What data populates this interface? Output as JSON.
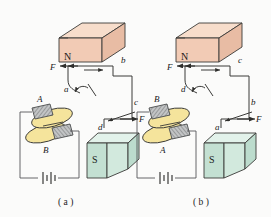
{
  "figure": {
    "type": "physics-diagram",
    "captions": [
      {
        "id": "caption-a",
        "text": "( a )"
      },
      {
        "id": "caption-b",
        "text": "( b )"
      }
    ],
    "colors": {
      "north_magnet_face": "#e8bca4",
      "north_magnet_top": "#f7ddcb",
      "north_magnet_side": "#f2cbb5",
      "south_magnet_face": "#c3e0d2",
      "south_magnet_top": "#e2f2ea",
      "south_magnet_side": "#d2e9dd",
      "commutator_disc": "#f5e49c",
      "brush_gray": "#b9bbbc",
      "wire": "#3a3a38",
      "background": "#fbfbfa"
    }
  },
  "panels": [
    {
      "id": "panel-a",
      "caption": "( a )",
      "magnets": [
        {
          "id": "north",
          "pole_label": "N",
          "position": "top"
        },
        {
          "id": "south",
          "pole_label": "S",
          "position": "bottom-right"
        }
      ],
      "loop_corner_labels": [
        "a",
        "b",
        "c",
        "d"
      ],
      "force_labels": [
        "F",
        "F"
      ],
      "brush_labels": [
        "A",
        "B"
      ],
      "battery_label": "",
      "arrow_directions": [
        "left",
        "right"
      ]
    },
    {
      "id": "panel-b",
      "caption": "( b )",
      "magnets": [
        {
          "id": "north",
          "pole_label": "N",
          "position": "top"
        },
        {
          "id": "south",
          "pole_label": "S",
          "position": "bottom-right"
        }
      ],
      "loop_corner_labels": [
        "d",
        "c",
        "b",
        "a"
      ],
      "force_labels": [
        "F",
        "F"
      ],
      "brush_labels": [
        "B",
        "A"
      ],
      "battery_label": "",
      "arrow_directions": [
        "left",
        "right"
      ]
    }
  ],
  "labels": {
    "n_pole": "N",
    "s_pole": "S",
    "force": "F",
    "corner_a": "a",
    "corner_b": "b",
    "corner_c": "c",
    "corner_d": "d",
    "brush_A": "A",
    "brush_B": "B"
  }
}
